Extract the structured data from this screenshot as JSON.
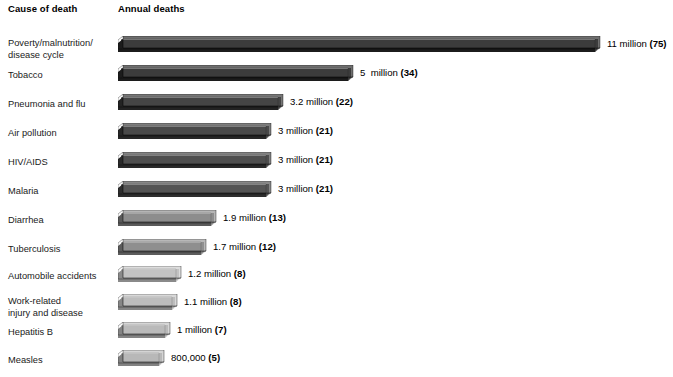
{
  "header": {
    "cause_label": "Cause of death",
    "deaths_label": "Annual deaths"
  },
  "chart_data": {
    "type": "bar",
    "title": "",
    "subtitle": "",
    "xlabel": "Annual deaths",
    "ylabel": "Cause of death",
    "orientation": "horizontal",
    "grid": false,
    "legend": null,
    "unit": "millions of deaths per year",
    "note": "Number in parentheses is deaths per 1000 / percentage share as printed on the chart",
    "xlim": [
      0,
      11
    ],
    "categories": [
      "Poverty/malnutrition/\ndisease cycle",
      "Tobacco",
      "Pneumonia and flu",
      "Air pollution",
      "HIV/AIDS",
      "Malaria",
      "Diarrhea",
      "Tuberculosis",
      "Automobile accidents",
      "Work-related\ninjury and disease",
      "Hepatitis B",
      "Measles"
    ],
    "values": [
      11,
      5,
      3.2,
      3,
      3,
      3,
      1.9,
      1.7,
      1.2,
      1.1,
      1,
      0.8
    ],
    "value_labels": [
      "11 million (75)",
      "5  million (34)",
      "3.2 million (22)",
      "3 million (21)",
      "3 million (21)",
      "3 million (21)",
      "1.9 million (13)",
      "1.7 million (12)",
      "1.2 million (8)",
      "1.1 million (8)",
      "1 million (7)",
      "800,000 (5)"
    ],
    "parenthetical": [
      75,
      34,
      22,
      21,
      21,
      21,
      13,
      12,
      8,
      8,
      7,
      5
    ]
  },
  "rows": [
    {
      "label": "Poverty/malnutrition/\ndisease cycle",
      "value_text": "11 million ",
      "paren_text": "(75)",
      "bar_px": 477,
      "top": 36,
      "label_top": 38,
      "face": "#3c3c3c",
      "top_face": "#6e6e6e",
      "bottom_face": "#1c1c1c"
    },
    {
      "label": "Tobacco",
      "value_text": "5  million ",
      "paren_text": "(34)",
      "bar_px": 230,
      "top": 65,
      "label_top": 70,
      "face": "#3c3c3c",
      "top_face": "#6e6e6e",
      "bottom_face": "#1c1c1c"
    },
    {
      "label": "Pneumonia and flu",
      "value_text": "3.2 million ",
      "paren_text": "(22)",
      "bar_px": 160,
      "top": 94,
      "label_top": 99,
      "face": "#454545",
      "top_face": "#767676",
      "bottom_face": "#232323"
    },
    {
      "label": "Air pollution",
      "value_text": "3 million ",
      "paren_text": "(21)",
      "bar_px": 148,
      "top": 123,
      "label_top": 128,
      "face": "#4a4a4a",
      "top_face": "#7d7d7d",
      "bottom_face": "#272727"
    },
    {
      "label": "HIV/AIDS",
      "value_text": "3 million ",
      "paren_text": "(21)",
      "bar_px": 148,
      "top": 152,
      "label_top": 157,
      "face": "#4f4f4f",
      "top_face": "#828282",
      "bottom_face": "#2a2a2a"
    },
    {
      "label": "Malaria",
      "value_text": "3 million ",
      "paren_text": "(21)",
      "bar_px": 148,
      "top": 181,
      "label_top": 186,
      "face": "#555555",
      "top_face": "#888888",
      "bottom_face": "#2e2e2e"
    },
    {
      "label": "Diarrhea",
      "value_text": "1.9 million ",
      "paren_text": "(13)",
      "bar_px": 93,
      "top": 210,
      "label_top": 215,
      "face": "#8d8d8d",
      "top_face": "#b5b5b5",
      "bottom_face": "#5a5a5a"
    },
    {
      "label": "Tuberculosis",
      "value_text": "1.7 million ",
      "paren_text": "(12)",
      "bar_px": 83,
      "top": 239,
      "label_top": 244,
      "face": "#8f8f8f",
      "top_face": "#b8b8b8",
      "bottom_face": "#5c5c5c"
    },
    {
      "label": "Automobile accidents",
      "value_text": "1.2 million ",
      "paren_text": "(8)",
      "bar_px": 58,
      "top": 266,
      "label_top": 271,
      "face": "#c2c2c2",
      "top_face": "#dcdcdc",
      "bottom_face": "#8a8a8a"
    },
    {
      "label": "Work-related\ninjury and disease",
      "value_text": "1.1 million ",
      "paren_text": "(8)",
      "bar_px": 54,
      "top": 294,
      "label_top": 296,
      "face": "#bdbdbd",
      "top_face": "#d8d8d8",
      "bottom_face": "#868686"
    },
    {
      "label": "Hepatitis B",
      "value_text": "1 million ",
      "paren_text": "(7)",
      "bar_px": 47,
      "top": 322,
      "label_top": 327,
      "face": "#bababa",
      "top_face": "#d6d6d6",
      "bottom_face": "#848484"
    },
    {
      "label": "Measles",
      "value_text": "800,000 ",
      "paren_text": "(5)",
      "bar_px": 41,
      "top": 350,
      "label_top": 355,
      "face": "#b8b8b8",
      "top_face": "#d4d4d4",
      "bottom_face": "#828282"
    }
  ]
}
